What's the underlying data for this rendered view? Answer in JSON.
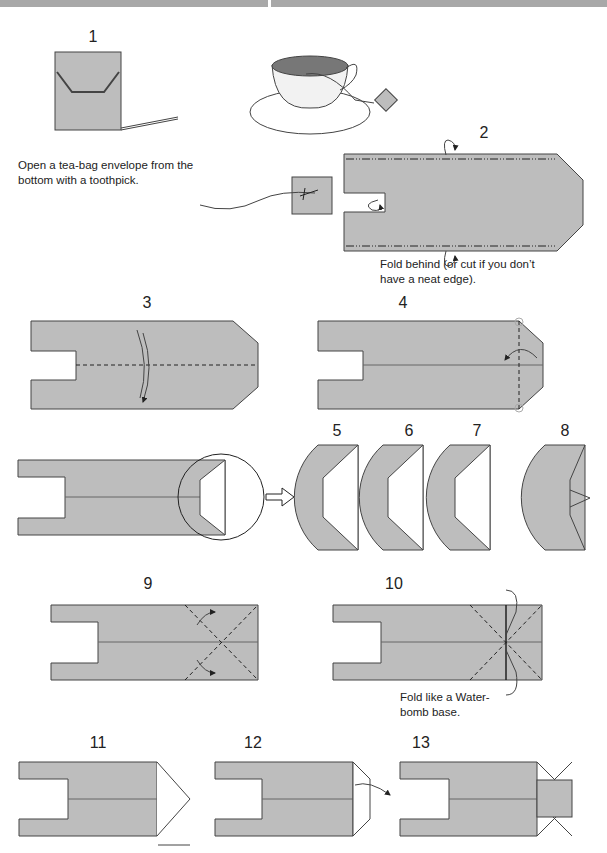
{
  "header": {
    "bar_color": "#a8a8a8"
  },
  "colors": {
    "paper": "#bdbdbd",
    "outline": "#444444",
    "background": "#ffffff"
  },
  "steps": [
    {
      "number": "1",
      "caption": "Open a tea-bag envelope from the bottom with a toothpick."
    },
    {
      "number": "2",
      "caption": "Fold behind (or cut if you don’t have a neat edge)."
    },
    {
      "number": "3"
    },
    {
      "number": "4"
    },
    {
      "number": "5"
    },
    {
      "number": "6"
    },
    {
      "number": "7"
    },
    {
      "number": "8"
    },
    {
      "number": "9"
    },
    {
      "number": "10",
      "caption": "Fold like a Water-bomb base."
    },
    {
      "number": "11"
    },
    {
      "number": "12"
    },
    {
      "number": "13"
    }
  ],
  "captions": {
    "step1_line1": "Open a tea-bag envelope from the",
    "step1_line2": "bottom with a toothpick.",
    "step2_line1": "Fold behind (or cut if you don’t",
    "step2_line2": "have a neat edge).",
    "step10_line1": "Fold like a Water-",
    "step10_line2": "bomb base."
  }
}
